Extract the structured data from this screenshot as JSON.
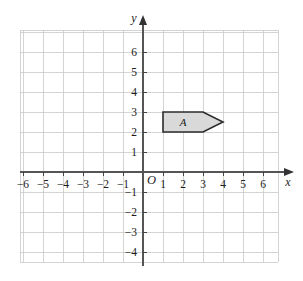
{
  "chart_data": {
    "type": "scatter",
    "title": "",
    "xlabel": "x",
    "ylabel": "y",
    "grid": true,
    "legend": false,
    "origin_label": "O",
    "xlim": [
      -6.9,
      6.9
    ],
    "ylim": [
      -4.9,
      6.9
    ],
    "x_tick_labels": [
      "−6",
      "−5",
      "−4",
      "−3",
      "−2",
      "−1",
      "1",
      "2",
      "3",
      "4",
      "5",
      "6"
    ],
    "x_tick_values": [
      -6,
      -5,
      -4,
      -3,
      -2,
      -1,
      1,
      2,
      3,
      4,
      5,
      6
    ],
    "y_tick_labels": [
      "6",
      "5",
      "4",
      "3",
      "2",
      "1",
      "−1",
      "−2",
      "−3",
      "−4"
    ],
    "y_tick_values": [
      6,
      5,
      4,
      3,
      2,
      1,
      -1,
      -2,
      -3,
      -4
    ],
    "shapes": [
      {
        "name": "A",
        "label": "A",
        "kind": "polygon",
        "vertices": [
          [
            1,
            3
          ],
          [
            3,
            3
          ],
          [
            4,
            2.5
          ],
          [
            3,
            2
          ],
          [
            1,
            2
          ]
        ],
        "label_position": [
          2,
          2.5
        ],
        "fill": "#d9d9d9",
        "stroke": "#2b2b2b"
      }
    ],
    "colors": {
      "grid_line": "#c9c9c9",
      "axis_line": "#555555",
      "background": "#ffffff",
      "text": "#1a1a1a"
    }
  },
  "figure": {
    "caption": ""
  }
}
